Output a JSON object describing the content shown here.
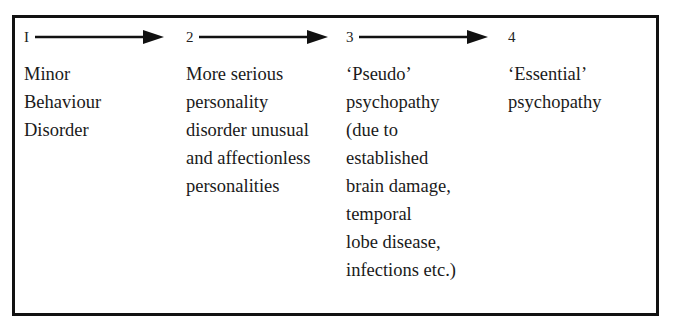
{
  "diagram": {
    "type": "progression",
    "stages": [
      {
        "number": "I",
        "lines": [
          "Minor",
          "Behaviour",
          "Disorder"
        ]
      },
      {
        "number": "2",
        "lines": [
          "More serious",
          "personality",
          "disorder unusual",
          "and affectionless",
          "personalities"
        ]
      },
      {
        "number": "3",
        "lines": [
          "‘Pseudo’",
          "psychopathy",
          "(due to",
          "established",
          "brain damage,",
          "temporal",
          "lobe disease,",
          "infections etc.)"
        ]
      },
      {
        "number": "4",
        "lines": [
          "‘Essential’",
          "psychopathy"
        ]
      }
    ],
    "arrows": [
      {
        "from": "I",
        "to": "2",
        "icon": "right-arrow-icon"
      },
      {
        "from": "2",
        "to": "3",
        "icon": "right-arrow-icon"
      },
      {
        "from": "3",
        "to": "4",
        "icon": "right-arrow-icon"
      }
    ],
    "colors": {
      "stroke": "#111111",
      "text": "#1a1a1a",
      "background": "#ffffff"
    }
  }
}
